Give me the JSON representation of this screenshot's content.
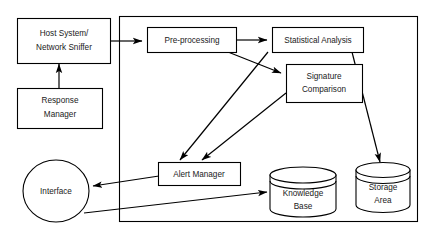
{
  "diagram": {
    "background_color": "#ffffff",
    "line_color": "#000000",
    "text_color": "#1a1a1a",
    "nodes": [
      {
        "id": "host-system",
        "shape": "rectangle",
        "lines": [
          "Host System/",
          "Network Sniffer"
        ]
      },
      {
        "id": "response-manager",
        "shape": "rectangle",
        "lines": [
          "Response",
          "Manager"
        ]
      },
      {
        "id": "pre-processing",
        "shape": "rectangle",
        "lines": [
          "Pre-processing"
        ]
      },
      {
        "id": "statistical-analysis",
        "shape": "rectangle",
        "lines": [
          "Statistical Analysis"
        ]
      },
      {
        "id": "signature-comparison",
        "shape": "rectangle",
        "lines": [
          "Signature",
          "Comparison"
        ]
      },
      {
        "id": "alert-manager",
        "shape": "rectangle",
        "lines": [
          "Alert Manager"
        ]
      },
      {
        "id": "interface",
        "shape": "ellipse",
        "lines": [
          "Interface"
        ]
      },
      {
        "id": "knowledge-base",
        "shape": "cylinder",
        "lines": [
          "Knowledge",
          "Base"
        ]
      },
      {
        "id": "storage-area",
        "shape": "cylinder",
        "lines": [
          "Storage",
          "Area"
        ]
      }
    ],
    "edges": [
      {
        "id": "host-to-preprocessing",
        "from": "host-system",
        "to": "pre-processing",
        "arrow": true
      },
      {
        "id": "response-to-host",
        "from": "response-manager",
        "to": "host-system",
        "arrow": true
      },
      {
        "id": "preprocessing-to-statistical",
        "from": "pre-processing",
        "to": "statistical-analysis",
        "arrow": true
      },
      {
        "id": "preprocessing-to-signature",
        "from": "pre-processing",
        "to": "signature-comparison",
        "arrow": true
      },
      {
        "id": "statistical-to-alert",
        "from": "statistical-analysis",
        "to": "alert-manager",
        "arrow": true
      },
      {
        "id": "signature-to-alert",
        "from": "signature-comparison",
        "to": "alert-manager",
        "arrow": true
      },
      {
        "id": "statistical-to-storage",
        "from": "statistical-analysis",
        "to": "storage-area",
        "arrow": true
      },
      {
        "id": "alert-to-interface",
        "from": "alert-manager",
        "to": "interface",
        "arrow": true
      },
      {
        "id": "interface-to-knowledge",
        "from": "interface",
        "to": "knowledge-base",
        "arrow": true
      }
    ]
  }
}
